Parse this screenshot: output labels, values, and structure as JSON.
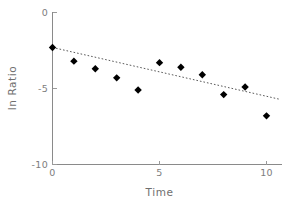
{
  "chart_data": {
    "type": "scatter",
    "title": "",
    "xlabel": "Time",
    "ylabel": "ln Ratio",
    "x": [
      0,
      1,
      2,
      3,
      4,
      5,
      6,
      7,
      8,
      9,
      10
    ],
    "values": [
      -2.3,
      -3.2,
      -3.7,
      -4.3,
      -5.1,
      -3.3,
      -3.6,
      -4.1,
      -5.4,
      -4.9,
      -6.8
    ],
    "series": [
      {
        "name": "ln Ratio",
        "marker": "filled-diamond",
        "color": "#000000",
        "values": [
          -2.3,
          -3.2,
          -3.7,
          -4.3,
          -5.1,
          -3.3,
          -3.6,
          -4.1,
          -5.4,
          -4.9,
          -6.8
        ]
      }
    ],
    "trendline": {
      "style": "dotted",
      "color": "#5a5a5a",
      "x_start": 0,
      "x_end": 10.65,
      "y_start": -2.3,
      "y_end": -5.72,
      "slope": -0.321,
      "intercept": -2.3
    },
    "xlim": [
      0,
      10.65
    ],
    "ylim": [
      -10,
      0
    ],
    "xticks": [
      0,
      5,
      10
    ],
    "xtick_labels": [
      "0",
      "5",
      "10"
    ],
    "yticks": [
      0,
      -5,
      -10
    ],
    "ytick_labels": [
      "0",
      "-5",
      "-10"
    ],
    "grid": false,
    "legend": null,
    "legend_position": "none",
    "background_color": "#ffffff",
    "axis_color": "#8a8a8a",
    "text_color": "#7d7d7d"
  },
  "axes": {
    "y_title": "ln Ratio",
    "x_title": "Time",
    "y_labels": {
      "top": "0",
      "middle": "-5",
      "bottom": "-10"
    },
    "x_labels": {
      "left": "0",
      "middle": "5",
      "right": "10"
    }
  }
}
